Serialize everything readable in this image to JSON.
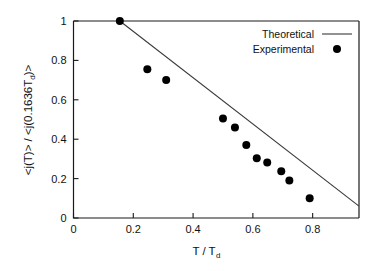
{
  "chart_data": {
    "type": "scatter",
    "title": "",
    "subtitle": "",
    "xlabel": "T / T",
    "xlabel_sub": "d",
    "ylabel_parts": {
      "p1": "<j(T)> / <j(0.1636T",
      "sub": "d",
      "p2": ")>"
    },
    "ylabel_full": "<j(T)> / <j(0.1636T_d)>",
    "xlim": [
      0,
      0.955
    ],
    "ylim": [
      0,
      1.0
    ],
    "xticks": [
      0,
      0.2,
      0.4,
      0.6,
      0.8
    ],
    "xticklabels": [
      "0",
      "0.2",
      "0.4",
      "0.6",
      "0.8"
    ],
    "yticks": [
      0,
      0.2,
      0.4,
      0.6,
      0.8,
      1
    ],
    "yticklabels": [
      "0",
      "0.2",
      "0.4",
      "0.6",
      "0.8",
      "1"
    ],
    "grid": false,
    "legend_position": "top-right-inside",
    "series": [
      {
        "name": "Theoretical",
        "type": "line",
        "color": "#3a3a3a",
        "x": [
          0.155,
          0.955
        ],
        "y": [
          1.0,
          0.06
        ]
      },
      {
        "name": "Experimental",
        "type": "scatter",
        "color": "#000000",
        "marker": "filled-circle",
        "x": [
          0.155,
          0.247,
          0.31,
          0.5,
          0.54,
          0.578,
          0.613,
          0.648,
          0.695,
          0.722,
          0.79
        ],
        "y": [
          1.0,
          0.755,
          0.7,
          0.505,
          0.46,
          0.37,
          0.303,
          0.282,
          0.237,
          0.19,
          0.1
        ]
      }
    ]
  },
  "legend": {
    "entries": [
      {
        "label": "Theoretical",
        "marker": "line"
      },
      {
        "label": "Experimental",
        "marker": "dot"
      }
    ]
  },
  "colors": {
    "axis": "#1a1a1a",
    "theory": "#3a3a3a",
    "marker": "#000000",
    "background": "#ffffff"
  }
}
